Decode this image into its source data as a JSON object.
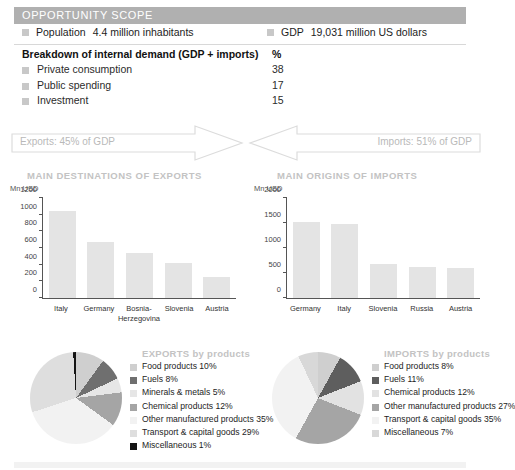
{
  "header": {
    "title": "OPPORTUNITY SCOPE",
    "bg_color": "#b0b0b0",
    "text_color": "#ffffff"
  },
  "facts": [
    {
      "label": "Population",
      "value": "4.4 million inhabitants"
    },
    {
      "label": "GDP",
      "value": "19,031 million US dollars"
    }
  ],
  "breakdown": {
    "title": "Breakdown of internal demand (GDP + imports)",
    "unit": "%",
    "rows": [
      {
        "name": "Private consumption",
        "value": "38"
      },
      {
        "name": "Public spending",
        "value": "17"
      },
      {
        "name": "Investment",
        "value": "15"
      }
    ]
  },
  "flows": {
    "exports_label": "Exports: 45% of GDP",
    "imports_label": "Imports: 51% of GDP",
    "outline_color": "#dcdcdc"
  },
  "sections": {
    "exports_title": "MAIN DESTINATIONS OF EXPORTS",
    "imports_title": "MAIN ORIGINS OF IMPORTS"
  },
  "chart_data": [
    {
      "type": "bar",
      "title": "MAIN DESTINATIONS OF EXPORTS",
      "ylabel": "Mn USD",
      "xlabel": "",
      "categories": [
        "Italy",
        "Germany",
        "Bosnia-Herzegovina",
        "Slovenia",
        "Austria"
      ],
      "values": [
        1050,
        670,
        545,
        420,
        250
      ],
      "ylim": [
        0,
        1200
      ],
      "yticks": [
        0,
        200,
        400,
        600,
        800,
        1000,
        1200
      ],
      "grid": false,
      "bar_color": "#e4e4e4"
    },
    {
      "type": "bar",
      "title": "MAIN ORIGINS OF IMPORTS",
      "ylabel": "Mn USD",
      "xlabel": "",
      "categories": [
        "Germany",
        "Italy",
        "Slovenia",
        "Russia",
        "Austria"
      ],
      "values": [
        1520,
        1480,
        680,
        630,
        595
      ],
      "ylim": [
        0,
        2000
      ],
      "yticks": [
        0,
        500,
        1000,
        1500,
        2000
      ],
      "grid": false,
      "bar_color": "#e4e4e4"
    },
    {
      "type": "pie",
      "title": "EXPORTS by products",
      "labels": [
        "Food products 10%",
        "Fuels 8%",
        "Minerals & metals 5%",
        "Chemical products 12%",
        "Other manufactured products 35%",
        "Transport & capital goods 29%",
        "Miscellaneous 1%"
      ],
      "categories": [
        "Food products",
        "Fuels",
        "Minerals & metals",
        "Chemical products",
        "Other manufactured products",
        "Transport & capital goods",
        "Miscellaneous"
      ],
      "values": [
        10,
        8,
        5,
        12,
        35,
        29,
        1
      ],
      "colors": [
        "#cfcfcf",
        "#6f6f6f",
        "#e6e6e6",
        "#a5a5a5",
        "#f2f2f2",
        "#dedede",
        "#141414"
      ]
    },
    {
      "type": "pie",
      "title": "IMPORTS by products",
      "labels": [
        "Food products 8%",
        "Fuels 11%",
        "Chemical products 12%",
        "Other manufactured products 27%",
        "Transport & capital goods 35%",
        "Miscellaneous 7%"
      ],
      "categories": [
        "Food products",
        "Fuels",
        "Chemical products",
        "Other manufactured products",
        "Transport & capital goods",
        "Miscellaneous"
      ],
      "values": [
        8,
        11,
        12,
        27,
        35,
        7
      ],
      "colors": [
        "#cfcfcf",
        "#5e5e5e",
        "#e2e2e2",
        "#a5a5a5",
        "#f2f2f2",
        "#d8d8d8"
      ]
    }
  ]
}
